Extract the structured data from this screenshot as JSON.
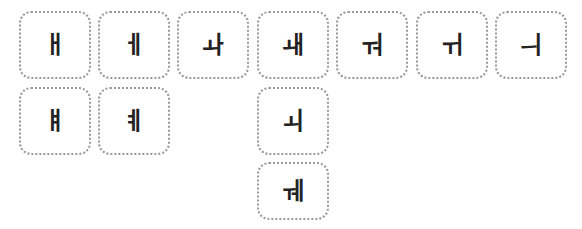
{
  "tiles": [
    {
      "id": "ae",
      "char": "ㅐ"
    },
    {
      "id": "e",
      "char": "ㅔ"
    },
    {
      "id": "wa",
      "char": "ㅘ"
    },
    {
      "id": "wae",
      "char": "ㅙ"
    },
    {
      "id": "wo",
      "char": "ㅝ"
    },
    {
      "id": "wi",
      "char": "ㅟ"
    },
    {
      "id": "ui",
      "char": "ㅢ"
    },
    {
      "id": "yae",
      "char": "ㅒ"
    },
    {
      "id": "ye",
      "char": "ㅖ"
    },
    {
      "id": "oe",
      "char": "ㅚ"
    },
    {
      "id": "we",
      "char": "ㅞ"
    }
  ],
  "colors": {
    "border": "#9a9a9a",
    "glyph": "#222222",
    "background": "#ffffff"
  }
}
